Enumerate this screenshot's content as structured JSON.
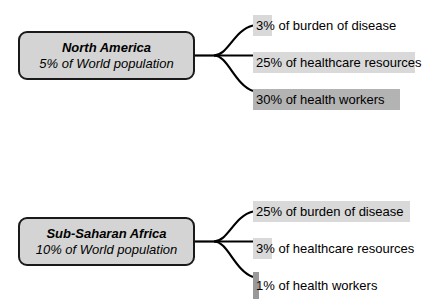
{
  "chart_data": {
    "type": "bar",
    "title": "",
    "xlabel": "",
    "ylabel": "",
    "grid": false,
    "legend": "none",
    "categories": [
      "burden of disease",
      "healthcare resources",
      "health workers"
    ],
    "series": [
      {
        "name": "North America",
        "population_share": "5% of World population",
        "values": [
          3,
          25,
          30
        ]
      },
      {
        "name": "Sub-Saharan Africa",
        "population_share": "10% of World population",
        "values": [
          25,
          3,
          1
        ]
      }
    ]
  },
  "colors": {
    "bar_light": "#d9d9d9",
    "bar_dark": "#b3b3b3",
    "box_fill": "#d4d4d4",
    "box_border": "#1a1a1a",
    "text": "#000000",
    "connector": "#000000"
  },
  "groups": [
    {
      "id": "north-america",
      "region_name": "North America",
      "region_sub": "5% of World population",
      "stats": [
        {
          "label": "3% of burden of disease",
          "value": 3,
          "bar_width": 19,
          "bar_color": "#d9d9d9",
          "tall": false
        },
        {
          "label": "25% of healthcare resources",
          "value": 25,
          "bar_width": 162,
          "bar_color": "#d9d9d9",
          "tall": false
        },
        {
          "label": "30% of health workers",
          "value": 30,
          "bar_width": 147,
          "bar_color": "#b3b3b3",
          "tall": false
        }
      ]
    },
    {
      "id": "sub-saharan-africa",
      "region_name": "Sub-Saharan Africa",
      "region_sub": "10% of World population",
      "stats": [
        {
          "label": "25% of burden of disease",
          "value": 25,
          "bar_width": 157,
          "bar_color": "#d9d9d9",
          "tall": false
        },
        {
          "label": "3% of healthcare resources",
          "value": 3,
          "bar_width": 19,
          "bar_color": "#d9d9d9",
          "tall": false
        },
        {
          "label": "1% of health workers",
          "value": 1,
          "bar_width": 6,
          "bar_color": "#999999",
          "tall": true
        }
      ]
    }
  ]
}
